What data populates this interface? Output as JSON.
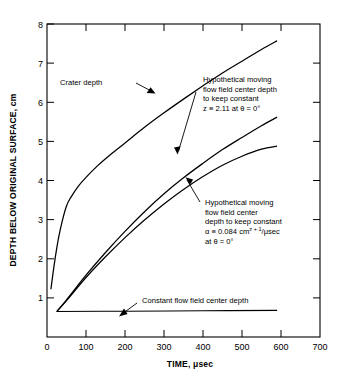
{
  "chart_data": {
    "type": "line",
    "title": "",
    "xlabel": "TIME, μsec",
    "ylabel": "DEPTH BELOW ORIGINAL SURFACE, cm",
    "xlim": [
      0,
      700
    ],
    "ylim": [
      0,
      8
    ],
    "xticks": [
      0,
      100,
      200,
      300,
      400,
      500,
      600,
      700
    ],
    "yticks": [
      1,
      2,
      3,
      4,
      5,
      6,
      7,
      8
    ],
    "xtick_labels": [
      "0",
      "100",
      "200",
      "300",
      "400",
      "500",
      "600",
      "700"
    ],
    "ytick_labels": [
      "1",
      "2",
      "3",
      "4",
      "5",
      "6",
      "7",
      "8"
    ],
    "grid": false,
    "legend": "none (inline annotations with leader lines)",
    "series": [
      {
        "name": "Crater depth",
        "x": [
          10,
          20,
          30,
          40,
          50,
          60,
          80,
          100,
          130,
          160,
          200,
          250,
          300,
          350,
          400,
          450,
          500,
          550,
          590
        ],
        "y": [
          1.22,
          1.95,
          2.55,
          3.0,
          3.35,
          3.55,
          3.85,
          4.08,
          4.38,
          4.64,
          4.96,
          5.36,
          5.73,
          6.08,
          6.42,
          6.75,
          7.05,
          7.35,
          7.57
        ]
      },
      {
        "name": "Hypothetical moving flow field center depth to keep constant z = 2.11 at theta = 0 deg",
        "x": [
          25,
          50,
          100,
          150,
          200,
          250,
          300,
          350,
          400,
          450,
          500,
          550,
          590
        ],
        "y": [
          0.65,
          0.95,
          1.58,
          2.16,
          2.7,
          3.2,
          3.66,
          4.07,
          4.44,
          4.79,
          5.1,
          5.4,
          5.62
        ]
      },
      {
        "name": "Hypothetical moving flow field center depth to keep constant alpha = 0.084 cm^(z+1)/usec at theta = 0 deg",
        "x": [
          25,
          50,
          100,
          150,
          200,
          250,
          300,
          350,
          400,
          450,
          500,
          550,
          590
        ],
        "y": [
          0.65,
          0.93,
          1.52,
          2.05,
          2.54,
          2.99,
          3.4,
          3.77,
          4.1,
          4.39,
          4.62,
          4.8,
          4.88
        ]
      },
      {
        "name": "Constant flow field center depth",
        "x": [
          25,
          200,
          400,
          590
        ],
        "y": [
          0.65,
          0.66,
          0.67,
          0.68
        ]
      }
    ],
    "annotations": [
      {
        "id": "crater-depth",
        "lines": [
          "Crater depth"
        ]
      },
      {
        "id": "hypothetical-z",
        "lines": [
          "Hypothetical moving",
          "flow field center depth",
          "to keep constant",
          "z ≡ 2.11 at θ = 0°"
        ]
      },
      {
        "id": "hypothetical-alpha",
        "lines": [
          "Hypothetical moving",
          "flow field center",
          "depth to keep constant",
          "α ≡ 0.084 cm",
          "at θ = 0°"
        ],
        "alpha_sup": "z + 1",
        "alpha_tail": "/μsec"
      },
      {
        "id": "constant-depth",
        "lines": [
          "Constant flow field center depth"
        ]
      }
    ]
  },
  "axes": {
    "x_label": "TIME, μsec",
    "y_label": "DEPTH BELOW ORIGINAL SURFACE, cm"
  },
  "colors": {
    "line": "#000000",
    "background": "#ffffff",
    "text": "#000000"
  }
}
